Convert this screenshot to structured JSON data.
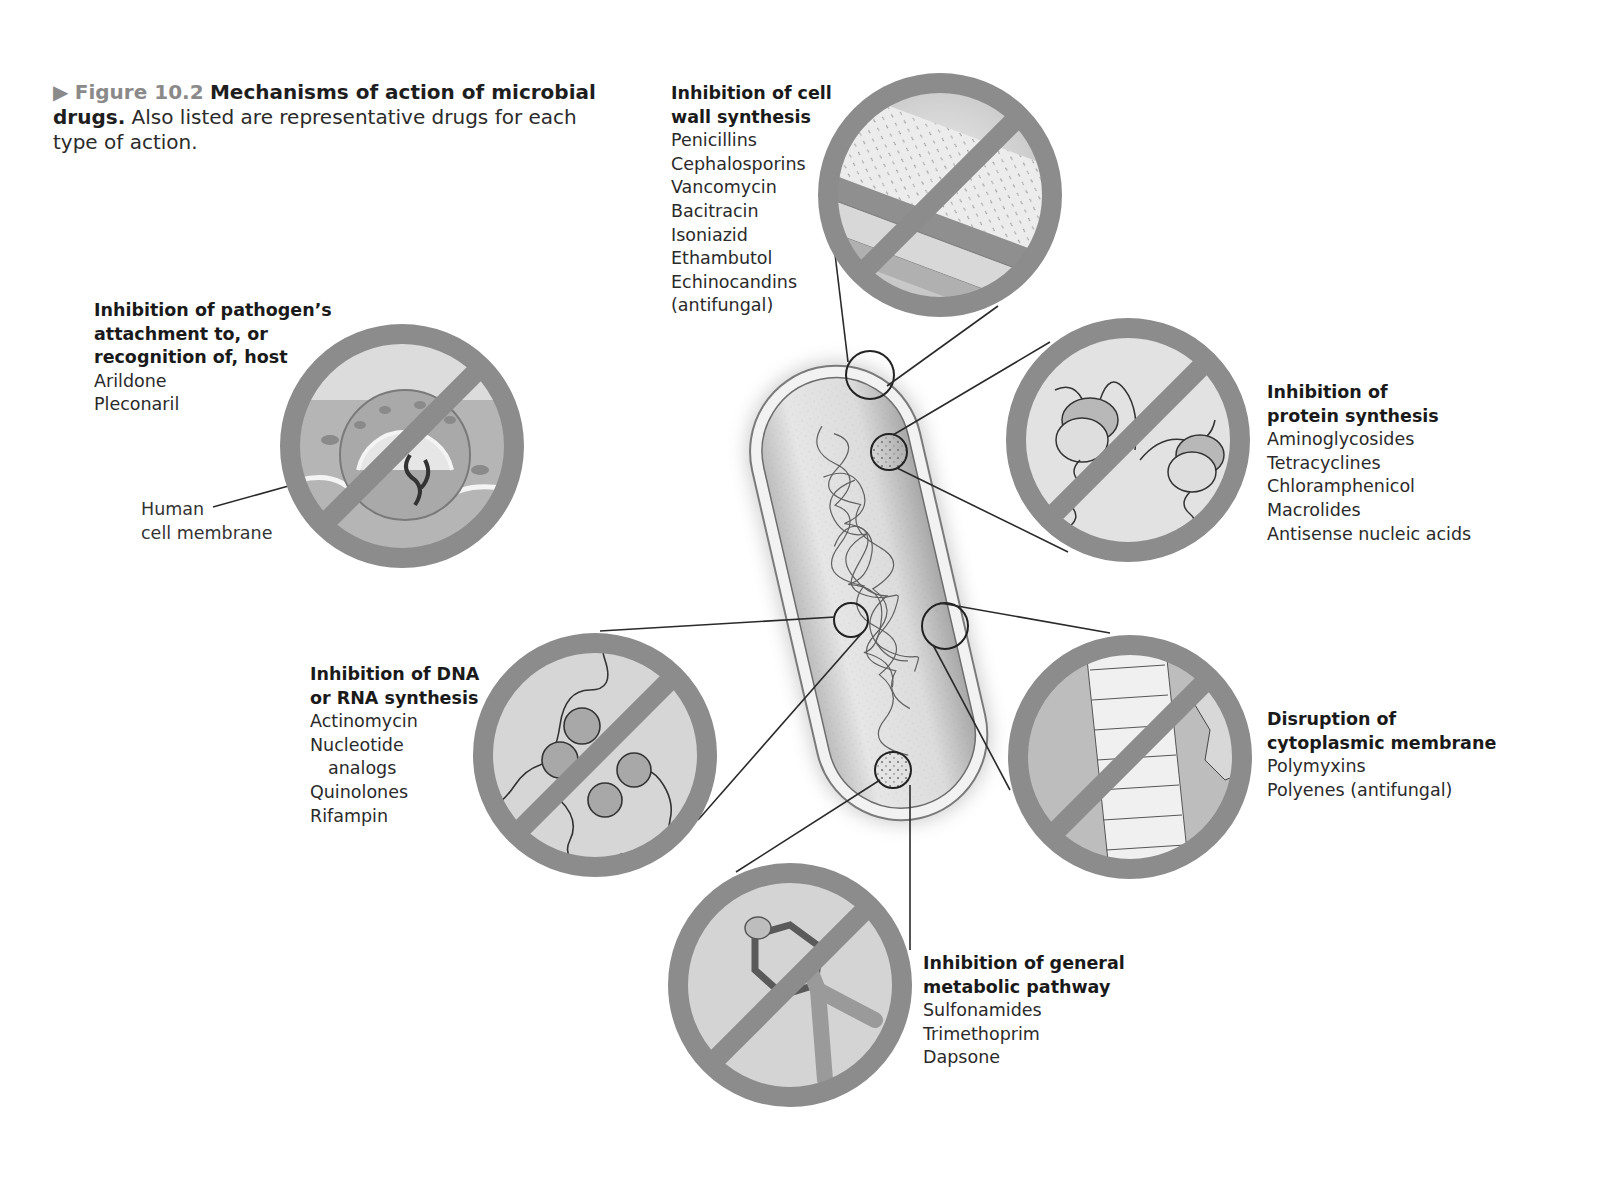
{
  "caption": {
    "marker": "▶",
    "figure_number": "Figure 10.2",
    "title": "Mechanisms of action of microbial drugs.",
    "description": "Also listed are representative drugs for each type of action."
  },
  "mechanisms": {
    "cell_wall": {
      "title_line1": "Inhibition of cell",
      "title_line2": "wall synthesis",
      "drugs": [
        "Penicillins",
        "Cephalosporins",
        "Vancomycin",
        "Bacitracin",
        "Isoniazid",
        "Ethambutol",
        "Echinocandins",
        "(antifungal)"
      ]
    },
    "attachment": {
      "title_line1": "Inhibition of pathogen’s",
      "title_line2": "attachment to, or",
      "title_line3": "recognition of, host",
      "drugs": [
        "Arildone",
        "Pleconaril"
      ],
      "annotation_line1": "Human",
      "annotation_line2": "cell membrane"
    },
    "protein": {
      "title_line1": "Inhibition of",
      "title_line2": "protein synthesis",
      "drugs": [
        "Aminoglycosides",
        "Tetracyclines",
        "Chloramphenicol",
        "Macrolides",
        "Antisense nucleic acids"
      ]
    },
    "nucleic_acid": {
      "title_line1": "Inhibition of DNA",
      "title_line2": "or RNA synthesis",
      "drugs": [
        "Actinomycin",
        "Nucleotide",
        "analogs",
        "Quinolones",
        "Rifampin"
      ]
    },
    "membrane": {
      "title_line1": "Disruption of",
      "title_line2": "cytoplasmic membrane",
      "drugs": [
        "Polymyxins",
        "Polyenes (antifungal)"
      ]
    },
    "metabolic": {
      "title_line1": "Inhibition of general",
      "title_line2": "metabolic pathway",
      "drugs": [
        "Sulfonamides",
        "Trimethoprim",
        "Dapsone"
      ]
    }
  },
  "colors": {
    "prohibition_ring": "#8c8c8c",
    "inset_fill": "#d9d9d9",
    "caption_figure": "#8a8a8a",
    "leader_line": "#2a2a2a"
  }
}
